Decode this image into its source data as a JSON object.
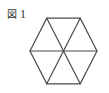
{
  "page": {
    "width": 109,
    "height": 93,
    "background_color": "#ffffff"
  },
  "caption": {
    "name": "figure-caption",
    "cjk_label": "図",
    "number": "1",
    "full_text": "図 1",
    "meaning": "Figure 1",
    "text_color": "#333333"
  },
  "figure": {
    "name": "hexagon-divided-into-six-triangles",
    "shape": "regular-hexagon",
    "orientation": "flat-top-pointy-left-right",
    "triangle_count": 6,
    "diagonal_count": 3,
    "stroke_color": "#4a4a4a",
    "fill_color": "none",
    "stroke_width": 1.2,
    "center": {
      "x": 63.5,
      "y": 51
    },
    "vertices": [
      {
        "label": "left",
        "x": 30.0,
        "y": 51.0
      },
      {
        "label": "upper-left",
        "x": 46.8,
        "y": 18.2
      },
      {
        "label": "upper-right",
        "x": 80.2,
        "y": 18.2
      },
      {
        "label": "right",
        "x": 97.0,
        "y": 51.0
      },
      {
        "label": "lower-right",
        "x": 80.2,
        "y": 83.8
      },
      {
        "label": "lower-left",
        "x": 46.8,
        "y": 83.8
      }
    ],
    "diagonals": [
      {
        "label": "horizontal",
        "from": "left",
        "to": "right"
      },
      {
        "label": "upper-left-diag",
        "from": "upper-left",
        "to": "lower-right"
      },
      {
        "label": "upper-right-diag",
        "from": "upper-right",
        "to": "lower-left"
      }
    ]
  }
}
